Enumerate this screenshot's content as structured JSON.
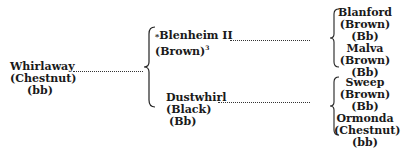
{
  "pedigree": {
    "subject": {
      "name": "Whirlaway",
      "color": "(Chestnut)",
      "genotype": "(bb)"
    },
    "sire": {
      "marker": "*",
      "name": "Blenheim II",
      "color": "(Brown)",
      "footnote": "3"
    },
    "dam": {
      "name": "Dustwhirl",
      "color": "(Black)",
      "genotype": "(Bb)"
    },
    "sire_parents": [
      {
        "name": "Blanford",
        "color": "(Brown)",
        "genotype": "(Bb)"
      },
      {
        "name": "Malva",
        "color": "(Brown)",
        "genotype": "(Bb)"
      }
    ],
    "dam_parents": [
      {
        "name": "Sweep",
        "color": "(Brown)",
        "genotype": "(Bb)"
      },
      {
        "name": "Ormonda",
        "color": "(Chestnut)",
        "genotype": "(bb)"
      }
    ]
  }
}
